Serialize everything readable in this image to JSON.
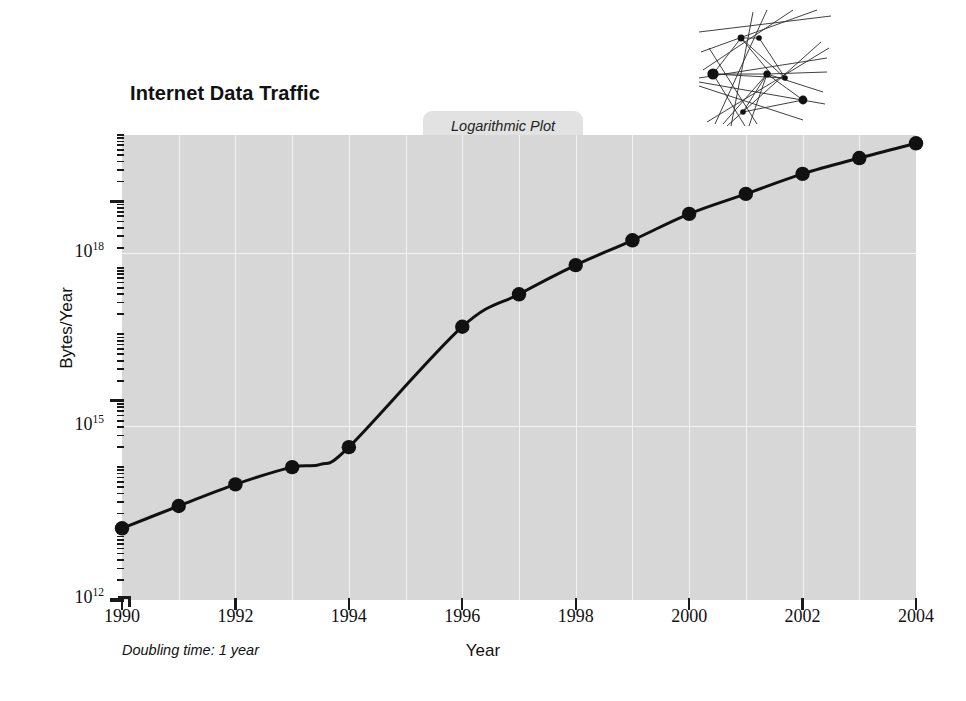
{
  "chart_data": {
    "type": "line",
    "title": "Internet Data Traffic",
    "subtitle": "Logarithmic Plot",
    "xlabel": "Year",
    "ylabel": "Bytes/Year",
    "annotation": "Doubling time: 1 year",
    "scale": "log",
    "grid": true,
    "legend": "none",
    "xlim": [
      1990,
      2004
    ],
    "ylim": [
      1000000000000.0,
      1e+19
    ],
    "xticks": [
      1990,
      1992,
      1994,
      1996,
      1998,
      2000,
      2002,
      2004
    ],
    "xtick_labels": [
      "1990",
      "1992",
      "1994",
      "1996",
      "1998",
      "2000",
      "2002",
      "2004"
    ],
    "ytick_labels": [
      "10",
      "10",
      "10"
    ],
    "ytick_exponents": [
      "18",
      "15",
      "12"
    ],
    "ytick_values": [
      1e+18,
      1000000000000000.0,
      1000000000000.0
    ],
    "x": [
      1990,
      1991,
      1992,
      1993,
      1993.5,
      1994,
      1996,
      1997,
      1998,
      1999,
      2000,
      2001,
      2002,
      2003,
      2004
    ],
    "values": [
      12000000000000.0,
      26000000000000.0,
      55000000000000.0,
      100000000000000.0,
      110000000000000.0,
      200000000000000.0,
      1.3e+16,
      4e+16,
      1.1e+17,
      2.6e+17,
      6.5e+17,
      1.3e+18,
      2.6e+18,
      4.5e+18,
      7.5e+18
    ],
    "series": [
      {
        "name": "Internet data traffic",
        "values": [
          12000000000000.0,
          26000000000000.0,
          55000000000000.0,
          100000000000000.0,
          110000000000000.0,
          200000000000000.0,
          1.3e+16,
          4e+16,
          1.1e+17,
          2.6e+17,
          6.5e+17,
          1.3e+18,
          2.6e+18,
          4.5e+18,
          7.5e+18
        ],
        "marker": "circle",
        "color": "#111111"
      }
    ],
    "marked_x": [
      1990,
      1991,
      1992,
      1993,
      1994,
      1996,
      1997,
      1998,
      1999,
      2000,
      2001,
      2002,
      2003,
      2004
    ]
  },
  "colors": {
    "plot_background": "#d7d7d7",
    "page_background": "#ffffff",
    "line": "#111111",
    "marker": "#111111",
    "gridline": "#f2f2f2",
    "tab_background": "#e2e2e2",
    "ink": "#111111"
  },
  "decoration": {
    "network_icon": "network-nodes-graphic"
  }
}
